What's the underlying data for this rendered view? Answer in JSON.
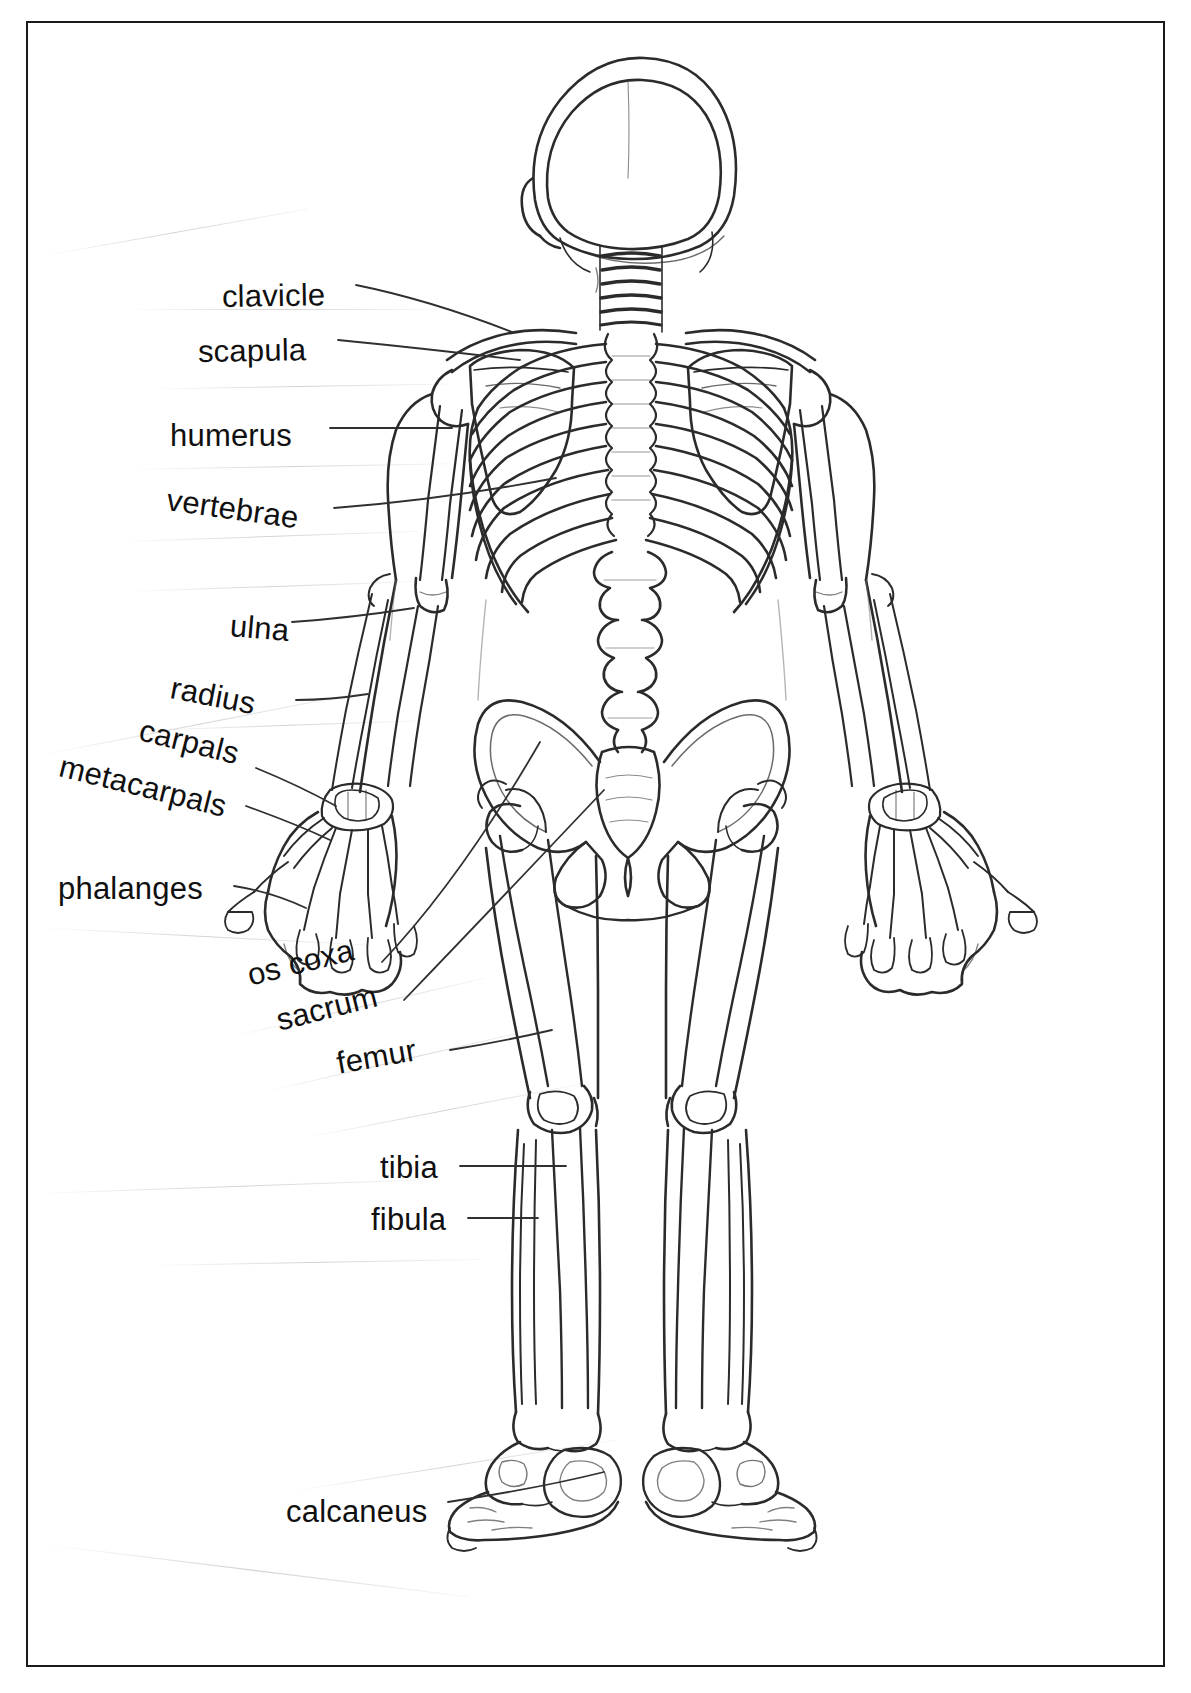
{
  "document": {
    "kind": "anatomy-worksheet",
    "view": "posterior (back) view of the human skeleton",
    "subject": "Human Skeleton — Labeled Bones",
    "border_color": "#1a1a1a",
    "background_color": "#ffffff",
    "ink_color": "#101010"
  },
  "labels": [
    {
      "id": "clavicle",
      "text": "clavicle",
      "x": 222,
      "y": 279,
      "size": 31,
      "rotate": -1,
      "leader": "diagonal-down-right"
    },
    {
      "id": "scapula",
      "text": "scapula",
      "x": 198,
      "y": 334,
      "size": 31,
      "rotate": -1,
      "leader": "straight-right"
    },
    {
      "id": "humerus",
      "text": "humerus",
      "x": 170,
      "y": 418,
      "size": 31,
      "rotate": 0,
      "leader": "straight-right"
    },
    {
      "id": "vertebrae",
      "text": "vertebrae",
      "x": 167,
      "y": 482,
      "size": 31,
      "rotate": 8,
      "leader": "straight-right"
    },
    {
      "id": "ulna",
      "text": "ulna",
      "x": 230,
      "y": 608,
      "size": 31,
      "rotate": 5,
      "leader": "straight-right"
    },
    {
      "id": "radius",
      "text": "radius",
      "x": 171,
      "y": 670,
      "size": 31,
      "rotate": 11,
      "leader": "straight-right"
    },
    {
      "id": "carpals",
      "text": "carpals",
      "x": 140,
      "y": 712,
      "size": 31,
      "rotate": 14,
      "leader": "diagonal-down-right"
    },
    {
      "id": "metacarpals",
      "text": "metacarpals",
      "x": 60,
      "y": 748,
      "size": 31,
      "rotate": 14,
      "leader": "diagonal-down-right"
    },
    {
      "id": "phalanges",
      "text": "phalanges",
      "x": 58,
      "y": 871,
      "size": 31,
      "rotate": 0,
      "leader": "straight-right"
    },
    {
      "id": "os-coxa",
      "text": "os coxa",
      "x": 248,
      "y": 958,
      "size": 31,
      "rotate": -14,
      "leader": "diagonal-up-right"
    },
    {
      "id": "sacrum",
      "text": "sacrum",
      "x": 277,
      "y": 1003,
      "size": 31,
      "rotate": -14,
      "leader": "diagonal-up-right"
    },
    {
      "id": "femur",
      "text": "femur",
      "x": 337,
      "y": 1046,
      "size": 31,
      "rotate": -10,
      "leader": "straight-right"
    },
    {
      "id": "tibia",
      "text": "tibia",
      "x": 380,
      "y": 1150,
      "size": 31,
      "rotate": 0,
      "leader": "straight-right"
    },
    {
      "id": "fibula",
      "text": "fibula",
      "x": 371,
      "y": 1202,
      "size": 31,
      "rotate": 0,
      "leader": "straight-right"
    },
    {
      "id": "calcaneus",
      "text": "calcaneus",
      "x": 286,
      "y": 1494,
      "size": 31,
      "rotate": 0,
      "leader": "straight-right"
    }
  ],
  "bone_list": [
    "clavicle",
    "scapula",
    "humerus",
    "vertebrae",
    "ulna",
    "radius",
    "carpals",
    "metacarpals",
    "phalanges",
    "os coxa",
    "sacrum",
    "femur",
    "tibia",
    "fibula",
    "calcaneus"
  ]
}
